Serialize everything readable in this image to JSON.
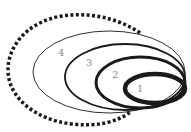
{
  "diagram": {
    "type": "nested-ellipses",
    "stroke_color": "#1a1a1a",
    "label_color": "#8a8a8a",
    "ellipses": [
      {
        "label": "1",
        "stroke_width": 4.5
      },
      {
        "label": "2",
        "stroke_width": 3
      },
      {
        "label": "3",
        "stroke_width": 1.8
      },
      {
        "label": "4",
        "stroke_width": 0.9
      }
    ],
    "outer_boundary": {
      "style": "dotted",
      "stroke_width": 3.5
    }
  }
}
